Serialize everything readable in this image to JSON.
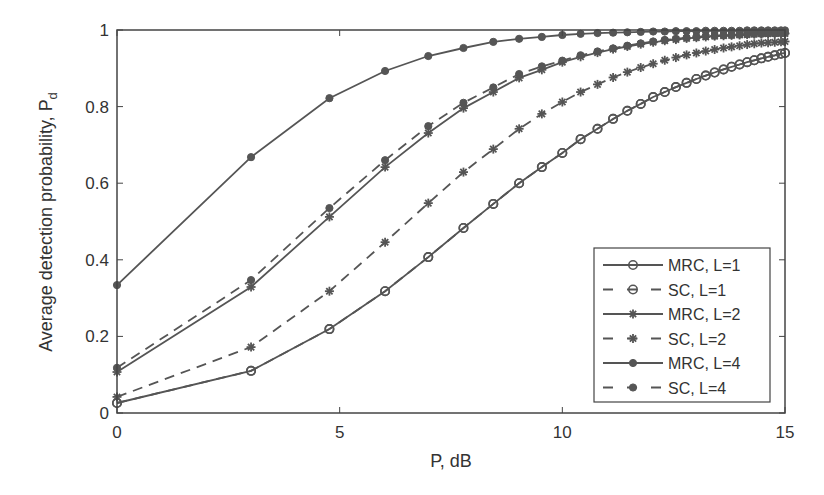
{
  "chart_data": {
    "type": "line",
    "title": "",
    "xlabel": "P, dB",
    "ylabel": "Average detection probability, P",
    "ylabel_subscript": "d",
    "xlim": [
      0,
      15
    ],
    "ylim": [
      0,
      1
    ],
    "xticks": [
      0,
      5,
      10,
      15
    ],
    "xtick_labels": [
      "0",
      "5",
      "10",
      "15"
    ],
    "yticks": [
      0,
      0.2,
      0.4,
      0.6,
      0.8,
      1
    ],
    "ytick_labels": [
      "0",
      "0.2",
      "0.4",
      "0.6",
      "0.8",
      "1"
    ],
    "grid": false,
    "legend_position": "lower right",
    "line_color": "#555555",
    "x": [
      0,
      3.01,
      4.77,
      6.02,
      6.99,
      7.78,
      8.45,
      9.03,
      9.54,
      10,
      10.41,
      10.79,
      11.14,
      11.46,
      11.76,
      12.04,
      12.3,
      12.55,
      12.79,
      13.01,
      13.22,
      13.42,
      13.62,
      13.8,
      13.98,
      14.15,
      14.31,
      14.47,
      14.62,
      14.77,
      14.91,
      15
    ],
    "series": [
      {
        "name": "MRC, L=1",
        "line": "solid",
        "marker": "circle-open",
        "values": [
          0.026,
          0.11,
          0.219,
          0.318,
          0.407,
          0.483,
          0.546,
          0.6,
          0.642,
          0.679,
          0.715,
          0.742,
          0.768,
          0.789,
          0.807,
          0.825,
          0.838,
          0.851,
          0.862,
          0.872,
          0.881,
          0.889,
          0.897,
          0.904,
          0.91,
          0.916,
          0.921,
          0.926,
          0.93,
          0.934,
          0.938,
          0.94
        ]
      },
      {
        "name": "SC, L=1",
        "line": "dashed",
        "marker": "circle-open",
        "values": [
          0.026,
          0.11,
          0.219,
          0.318,
          0.407,
          0.483,
          0.546,
          0.6,
          0.642,
          0.679,
          0.715,
          0.742,
          0.768,
          0.789,
          0.807,
          0.825,
          0.838,
          0.851,
          0.862,
          0.872,
          0.881,
          0.889,
          0.897,
          0.904,
          0.91,
          0.916,
          0.921,
          0.926,
          0.93,
          0.934,
          0.938,
          0.94
        ]
      },
      {
        "name": "MRC, L=2",
        "line": "solid",
        "marker": "asterisk",
        "values": [
          0.107,
          0.329,
          0.512,
          0.642,
          0.731,
          0.796,
          0.838,
          0.875,
          0.896,
          0.916,
          0.93,
          0.941,
          0.95,
          0.957,
          0.963,
          0.968,
          0.972,
          0.975,
          0.978,
          0.98,
          0.982,
          0.984,
          0.985,
          0.986,
          0.987,
          0.988,
          0.989,
          0.99,
          0.99,
          0.991,
          0.991,
          0.991
        ]
      },
      {
        "name": "SC, L=2",
        "line": "dashed",
        "marker": "asterisk",
        "values": [
          0.042,
          0.172,
          0.318,
          0.446,
          0.548,
          0.629,
          0.689,
          0.742,
          0.781,
          0.812,
          0.838,
          0.858,
          0.876,
          0.89,
          0.902,
          0.912,
          0.921,
          0.928,
          0.935,
          0.94,
          0.945,
          0.949,
          0.953,
          0.956,
          0.959,
          0.962,
          0.964,
          0.966,
          0.967,
          0.968,
          0.969,
          0.97
        ]
      },
      {
        "name": "MRC, L=4",
        "line": "solid",
        "marker": "dot",
        "values": [
          0.334,
          0.668,
          0.822,
          0.893,
          0.932,
          0.953,
          0.969,
          0.977,
          0.982,
          0.987,
          0.99,
          0.992,
          0.993,
          0.994,
          0.995,
          0.996,
          0.996,
          0.997,
          0.997,
          0.997,
          0.998,
          0.998,
          0.998,
          0.998,
          0.998,
          0.999,
          0.999,
          0.999,
          0.999,
          0.999,
          0.999,
          0.999
        ]
      },
      {
        "name": "SC, L=4",
        "line": "dashed",
        "marker": "dot",
        "values": [
          0.118,
          0.347,
          0.535,
          0.66,
          0.749,
          0.81,
          0.85,
          0.885,
          0.905,
          0.92,
          0.934,
          0.944,
          0.952,
          0.959,
          0.965,
          0.97,
          0.974,
          0.977,
          0.98,
          0.982,
          0.984,
          0.985,
          0.986,
          0.987,
          0.988,
          0.989,
          0.99,
          0.99,
          0.991,
          0.991,
          0.992,
          0.992
        ]
      }
    ]
  }
}
